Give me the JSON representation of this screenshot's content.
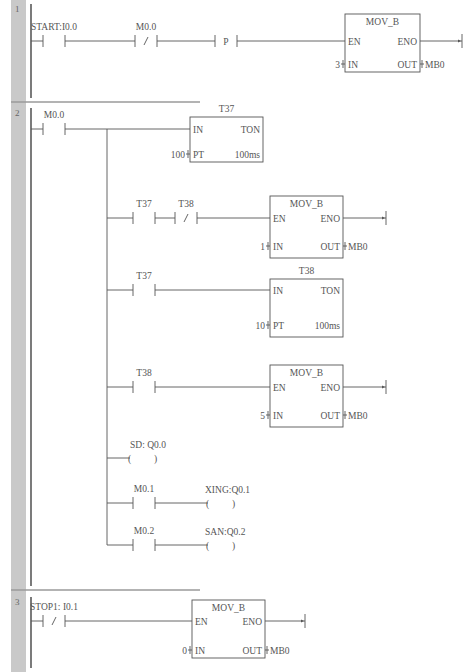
{
  "networks": [
    {
      "number": "1",
      "y0": 0,
      "y1": 102,
      "rungs": [
        {
          "y": 41,
          "contacts": [
            {
              "type": "NO",
              "x": 43,
              "label": "START:I0.0"
            },
            {
              "type": "NC",
              "x": 135,
              "label": "M0.0"
            },
            {
              "type": "P",
              "x": 215,
              "label": ""
            }
          ],
          "box": {
            "x": 345,
            "w": 75,
            "top": 14,
            "h": 58,
            "title": "MOV_B",
            "left_pins": [
              {
                "name": "EN",
                "dy": 27
              },
              {
                "name": "IN",
                "dy": 50,
                "value": "3"
              }
            ],
            "right_pins": [
              {
                "name": "ENO",
                "dy": 27,
                "end_coil": true,
                "end_x": 462
              },
              {
                "name": "OUT",
                "dy": 50,
                "value": "MB0"
              }
            ]
          }
        }
      ]
    },
    {
      "number": "2",
      "y0": 104,
      "y1": 590,
      "main_contact": {
        "type": "NO",
        "x": 43,
        "label": "M0.0",
        "y": 129
      },
      "branch_x": 107,
      "rungs": [
        {
          "y": 129,
          "contacts": [],
          "box": {
            "x": 190,
            "w": 73,
            "top": 117,
            "h": 45,
            "title": "T37",
            "title_above": true,
            "left_pins": [
              {
                "name": "IN",
                "dy": 12
              },
              {
                "name": "PT",
                "dy": 37,
                "value": "100"
              }
            ],
            "right_pins": [
              {
                "name": "TON",
                "dy": 12,
                "no_wire": true
              },
              {
                "name": "100ms",
                "dy": 37,
                "no_wire": true
              }
            ]
          }
        },
        {
          "y": 218,
          "contacts": [
            {
              "type": "NO",
              "x": 133,
              "label": "T37"
            },
            {
              "type": "NC",
              "x": 175,
              "label": "T38"
            }
          ],
          "box": {
            "x": 270,
            "w": 73,
            "top": 196,
            "h": 62,
            "title": "MOV_B",
            "left_pins": [
              {
                "name": "EN",
                "dy": 22
              },
              {
                "name": "IN",
                "dy": 50,
                "value": "1"
              }
            ],
            "right_pins": [
              {
                "name": "ENO",
                "dy": 22,
                "end_coil": true,
                "end_x": 386
              },
              {
                "name": "OUT",
                "dy": 50,
                "value": "MB0"
              }
            ]
          }
        },
        {
          "y": 290,
          "contacts": [
            {
              "type": "NO",
              "x": 133,
              "label": "T37"
            }
          ],
          "box": {
            "x": 270,
            "w": 73,
            "top": 279,
            "h": 58,
            "title": "T38",
            "title_above": true,
            "left_pins": [
              {
                "name": "IN",
                "dy": 11
              },
              {
                "name": "PT",
                "dy": 46,
                "value": "10"
              }
            ],
            "right_pins": [
              {
                "name": "TON",
                "dy": 11,
                "no_wire": true
              },
              {
                "name": "100ms",
                "dy": 46,
                "no_wire": true
              }
            ]
          }
        },
        {
          "y": 387,
          "contacts": [
            {
              "type": "NO",
              "x": 133,
              "label": "T38"
            }
          ],
          "box": {
            "x": 270,
            "w": 73,
            "top": 365,
            "h": 62,
            "title": "MOV_B",
            "left_pins": [
              {
                "name": "EN",
                "dy": 22
              },
              {
                "name": "IN",
                "dy": 50,
                "value": "5"
              }
            ],
            "right_pins": [
              {
                "name": "ENO",
                "dy": 22,
                "end_coil": true,
                "end_x": 386
              },
              {
                "name": "OUT",
                "dy": 50,
                "value": "MB0"
              }
            ]
          }
        },
        {
          "y": 458,
          "contacts": [],
          "coil": {
            "x": 130,
            "label": "SD: Q0.0",
            "label_x": 130
          }
        },
        {
          "y": 503,
          "contacts": [
            {
              "type": "NO",
              "x": 133,
              "label": "M0.1"
            }
          ],
          "coil": {
            "x": 208,
            "label": "XING:Q0.1",
            "label_x": 205
          }
        },
        {
          "y": 545,
          "contacts": [
            {
              "type": "NO",
              "x": 133,
              "label": "M0.2"
            }
          ],
          "coil": {
            "x": 208,
            "label": "SAN:Q0.2",
            "label_x": 205
          }
        }
      ]
    },
    {
      "number": "3",
      "y0": 593,
      "y1": 672,
      "rungs": [
        {
          "y": 621,
          "contacts": [
            {
              "type": "NC",
              "x": 43,
              "label": "STOP1: I0.1"
            }
          ],
          "box": {
            "x": 192,
            "w": 73,
            "top": 600,
            "h": 58,
            "title": "MOV_B",
            "left_pins": [
              {
                "name": "EN",
                "dy": 21
              },
              {
                "name": "IN",
                "dy": 50,
                "value": "0"
              }
            ],
            "right_pins": [
              {
                "name": "ENO",
                "dy": 21,
                "end_coil": true,
                "end_x": 305
              },
              {
                "name": "OUT",
                "dy": 50,
                "value": "MB0"
              }
            ]
          }
        }
      ]
    }
  ]
}
